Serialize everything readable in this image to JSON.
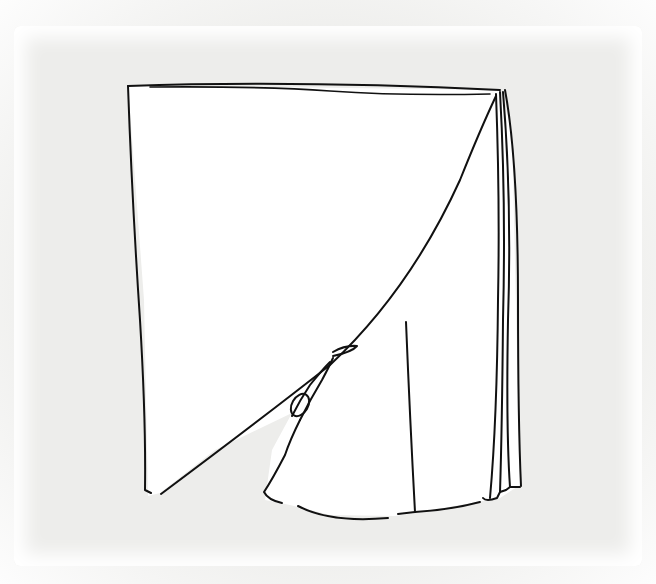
{
  "image": {
    "subject": "line sketch of a standing book with a large page curling open",
    "background_color": "#eeeeec",
    "sheet_color": "#ffffff",
    "ink_color": "#111111"
  }
}
